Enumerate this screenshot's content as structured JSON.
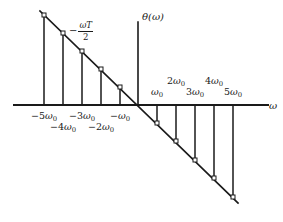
{
  "figure": {
    "axes": {
      "x_axis_label": "ω",
      "y_axis_label": "θ(ω)"
    },
    "annotations": {
      "slope_minus": "−",
      "slope_numerator": "ωT",
      "slope_denominator": "2"
    }
  },
  "chart_data": {
    "type": "scatter",
    "title": "",
    "subtitle": "",
    "xlabel": "ω",
    "ylabel": "θ(ω)",
    "grid": false,
    "legend": null,
    "annotations": [
      {
        "text": "−ωT/2",
        "meaning": "slope of the phase line",
        "x_px": 69,
        "y_px": 21
      }
    ],
    "x_unit": "ω₀",
    "xlim": [
      -5.8,
      5.8
    ],
    "ylim_units": "−ωT/2 per unit ω",
    "slope_sign": "negative",
    "stem_marker": "open-square",
    "x": [
      -5,
      -4,
      -3,
      -2,
      -1,
      0,
      1,
      2,
      3,
      4,
      5
    ],
    "y": [
      5,
      4,
      3,
      2,
      1,
      0,
      -1,
      -2,
      -3,
      -4,
      -5
    ],
    "x_tick_labels": [
      "−5ω₀",
      "−4ω₀",
      "−3ω₀",
      "−2ω₀",
      "−ω₀",
      "ω₀",
      "2ω₀",
      "3ω₀",
      "4ω₀",
      "5ω₀"
    ],
    "points": [
      {
        "label": "−5ω₀",
        "n": -5,
        "x_px": 44,
        "y_px": 15,
        "side": "negative",
        "tick_row": "upper"
      },
      {
        "label": "−4ω₀",
        "n": -4,
        "x_px": 63,
        "y_px": 33,
        "side": "negative",
        "tick_row": "lower"
      },
      {
        "label": "−3ω₀",
        "n": -3,
        "x_px": 82,
        "y_px": 51,
        "side": "negative",
        "tick_row": "upper"
      },
      {
        "label": "−2ω₀",
        "n": -2,
        "x_px": 101,
        "y_px": 69,
        "side": "negative",
        "tick_row": "lower"
      },
      {
        "label": "−ω₀",
        "n": -1,
        "x_px": 120,
        "y_px": 87,
        "side": "negative",
        "tick_row": "upper"
      },
      {
        "label": "ω₀",
        "n": 1,
        "x_px": 157,
        "y_px": 123,
        "side": "positive",
        "tick_row": "lower"
      },
      {
        "label": "2ω₀",
        "n": 2,
        "x_px": 176,
        "y_px": 141,
        "side": "positive",
        "tick_row": "upper"
      },
      {
        "label": "3ω₀",
        "n": 3,
        "x_px": 195,
        "y_px": 160,
        "side": "positive",
        "tick_row": "lower"
      },
      {
        "label": "4ω₀",
        "n": 4,
        "x_px": 214,
        "y_px": 178,
        "side": "positive",
        "tick_row": "upper"
      },
      {
        "label": "5ω₀",
        "n": 5,
        "x_px": 233,
        "y_px": 197,
        "side": "positive",
        "tick_row": "lower"
      }
    ],
    "line": {
      "x1_px": 40,
      "y1_px": 11,
      "x2_px": 238,
      "y2_px": 203
    },
    "axis_geometry": {
      "x_axis_y_px": 105,
      "x_axis_x1_px": 14,
      "x_axis_x2_px": 268,
      "y_axis_x_px": 138,
      "y_axis_y1_px": 22,
      "y_axis_y2_px": 105
    }
  }
}
